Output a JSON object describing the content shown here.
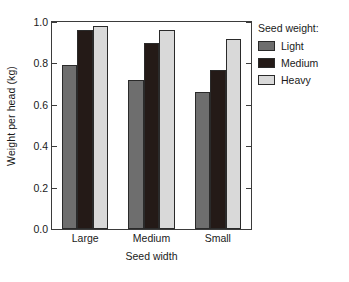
{
  "chart_data": {
    "type": "bar",
    "title": "",
    "xlabel": "Seed width",
    "ylabel": "Weight per head (kg)",
    "categories": [
      "Large",
      "Medium",
      "Small"
    ],
    "series": [
      {
        "name": "Light",
        "color": "#6e6e6e",
        "values": [
          0.79,
          0.72,
          0.66
        ]
      },
      {
        "name": "Medium",
        "color": "#241a17",
        "values": [
          0.96,
          0.9,
          0.77
        ]
      },
      {
        "name": "Heavy",
        "color": "#d9d9d9",
        "values": [
          0.98,
          0.96,
          0.92
        ]
      }
    ],
    "ylim": [
      0.0,
      1.0
    ],
    "yticks": [
      0.0,
      0.2,
      0.4,
      0.6,
      0.8,
      1.0
    ],
    "ytick_labels": [
      "0.0",
      "0.2",
      "0.4",
      "0.6",
      "0.8",
      "1.0"
    ],
    "grid": false,
    "legend_position": "right",
    "legend_title": "Seed weight:",
    "legend_entries": [
      "Light",
      "Medium",
      "Heavy"
    ]
  },
  "axes": {
    "y_title": "Weight per head (kg)",
    "x_title": "Seed width"
  },
  "legend": {
    "title": "Seed weight:"
  }
}
